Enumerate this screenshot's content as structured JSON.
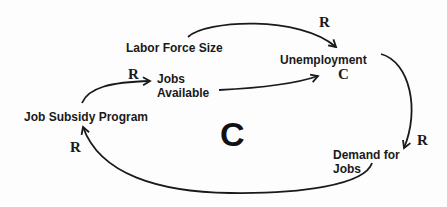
{
  "diagram": {
    "type": "causal-loop-diagram",
    "nodes": {
      "labor_force_size": "Labor Force Size",
      "unemployment": "Unemployment",
      "jobs_available_line1": "Jobs",
      "jobs_available_line2": "Available",
      "job_subsidy_program": "Job Subsidy Program",
      "demand_for_jobs_line1": "Demand for",
      "demand_for_jobs_line2": "Jobs"
    },
    "links": [
      {
        "from": "Labor Force Size",
        "to": "Unemployment",
        "polarity": "R"
      },
      {
        "from": "Jobs Available",
        "to": "Unemployment",
        "polarity": "C"
      },
      {
        "from": "Job Subsidy Program",
        "to": "Jobs Available",
        "polarity": "R"
      },
      {
        "from": "Unemployment",
        "to": "Demand for Jobs",
        "polarity": "R"
      },
      {
        "from": "Demand for Jobs",
        "to": "Job Subsidy Program",
        "polarity": "R"
      }
    ],
    "polarity_labels": {
      "labor_to_unemployment": "R",
      "jobs_to_unemployment": "C",
      "subsidy_to_jobs": "R",
      "unemployment_to_demand": "R",
      "demand_to_subsidy": "R"
    },
    "loop_label": "C",
    "colors": {
      "line": "#1a1a1a",
      "text": "#1a1a1a",
      "background": "#fdfdfd"
    }
  }
}
